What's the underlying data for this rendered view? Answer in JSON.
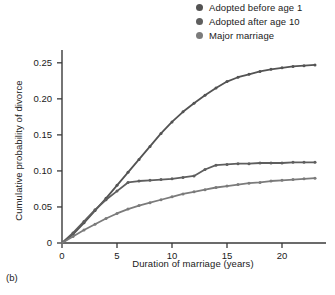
{
  "panel": {
    "tag": "(b)"
  },
  "legend": {
    "position": "top-right",
    "items": [
      {
        "label": "Adopted before age 1",
        "color": "#535353",
        "marker": "legend-dot-icon"
      },
      {
        "label": "Adopted after age 10",
        "color": "#5e5e5e",
        "marker": "legend-dot-icon"
      },
      {
        "label": "Major marriage",
        "color": "#7b7b7b",
        "marker": "legend-dot-icon"
      }
    ]
  },
  "axes": {
    "xlabel": "Duration of marriage (years)",
    "ylabel": "Cumulative probability of divorce",
    "xticks": [
      "0",
      "5",
      "10",
      "15",
      "20"
    ],
    "yticks": [
      "0",
      "0.05",
      "0.10",
      "0.15",
      "0.20",
      "0.25"
    ]
  },
  "chart_data": {
    "type": "line",
    "title": "",
    "subtitle": "",
    "xlabel": "Duration of marriage (years)",
    "ylabel": "Cumulative probability of divorce",
    "xlim": [
      0,
      24
    ],
    "ylim": [
      0,
      0.265
    ],
    "xticks": [
      0,
      5,
      10,
      15,
      20
    ],
    "yticks": [
      0,
      0.05,
      0.1,
      0.15,
      0.2,
      0.25
    ],
    "grid": false,
    "legend_position": "top-right",
    "x": [
      0,
      1,
      2,
      3,
      4,
      5,
      6,
      7,
      8,
      9,
      10,
      11,
      12,
      13,
      14,
      15,
      16,
      17,
      18,
      19,
      20,
      21,
      22,
      23
    ],
    "series": [
      {
        "name": "Adopted before age 1",
        "color": "#535353",
        "values": [
          0.0,
          0.012,
          0.028,
          0.045,
          0.062,
          0.08,
          0.098,
          0.116,
          0.134,
          0.152,
          0.168,
          0.182,
          0.194,
          0.205,
          0.215,
          0.224,
          0.23,
          0.234,
          0.238,
          0.241,
          0.243,
          0.245,
          0.246,
          0.247
        ]
      },
      {
        "name": "Adopted after age 10",
        "color": "#5e5e5e",
        "values": [
          0.0,
          0.014,
          0.03,
          0.046,
          0.06,
          0.072,
          0.084,
          0.086,
          0.087,
          0.088,
          0.089,
          0.091,
          0.093,
          0.102,
          0.108,
          0.109,
          0.11,
          0.11,
          0.111,
          0.111,
          0.111,
          0.112,
          0.112,
          0.112
        ]
      },
      {
        "name": "Major marriage",
        "color": "#7b7b7b",
        "values": [
          0.0,
          0.009,
          0.018,
          0.026,
          0.034,
          0.041,
          0.047,
          0.052,
          0.056,
          0.06,
          0.064,
          0.068,
          0.071,
          0.074,
          0.077,
          0.079,
          0.081,
          0.083,
          0.084,
          0.086,
          0.087,
          0.088,
          0.089,
          0.09
        ]
      }
    ]
  }
}
